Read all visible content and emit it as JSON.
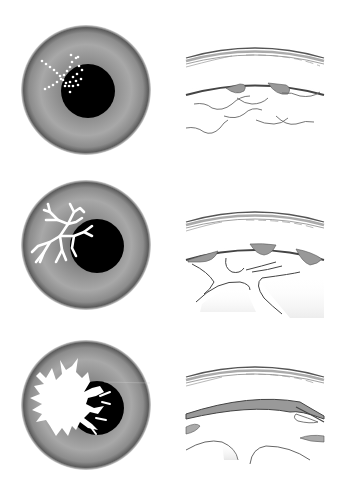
{
  "diagram": {
    "type": "medical-illustration",
    "layout": "3 rows x 2 columns",
    "colors": {
      "background": "#ffffff",
      "iris_dark": "#6e6e6e",
      "iris_light": "#b8b8b8",
      "pupil": "#000000",
      "lesion": "#ffffff",
      "epithelium_fill": "#9a9a9a",
      "line": "#555555"
    },
    "rows": [
      {
        "stage": 1,
        "front_view": {
          "lesion_pattern": "punctate dots",
          "lesion_color": "#ffffff"
        },
        "cross_section": {
          "layers": [
            "cornea outer surface",
            "epithelium with small defects",
            "stromal nerve fibers (wavy)"
          ]
        }
      },
      {
        "stage": 2,
        "front_view": {
          "lesion_pattern": "dendritic branching",
          "lesion_color": "#ffffff"
        },
        "cross_section": {
          "layers": [
            "cornea outer surface",
            "epithelium with scalloped gaps",
            "branching stromal lesion"
          ]
        }
      },
      {
        "stage": 3,
        "front_view": {
          "lesion_pattern": "geographic ulcer with dendritic edges",
          "lesion_color": "#ffffff"
        },
        "cross_section": {
          "layers": [
            "cornea outer surface",
            "thinned epithelium band",
            "stromal voids"
          ]
        }
      }
    ]
  }
}
